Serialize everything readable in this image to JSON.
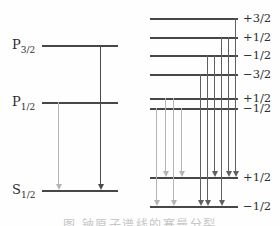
{
  "colors": {
    "background": "#fefefe",
    "level_line": "#474747",
    "label": "#2e2e2e",
    "light_arrow": "#b5b5b5",
    "dark_arrow": "#606060",
    "left_dark_arrow": "#4a4a4a",
    "caption": "#c6c6c6"
  },
  "left_diagram": {
    "label_x": 12,
    "levels": [
      {
        "name": "P3/2",
        "label_main": "P",
        "label_sub": "3/2",
        "x": 42,
        "width": 76,
        "y": 45
      },
      {
        "name": "P1/2",
        "label_main": "P",
        "label_sub": "1/2",
        "x": 42,
        "width": 76,
        "y": 102
      },
      {
        "name": "S1/2",
        "label_main": "S",
        "label_sub": "1/2",
        "x": 42,
        "width": 76,
        "y": 190
      }
    ],
    "transitions": [
      {
        "from": "P1/2",
        "to": "S1/2",
        "x": 58,
        "y1": 102,
        "y2": 190,
        "shade": "light"
      },
      {
        "from": "P3/2",
        "to": "S1/2",
        "x": 100,
        "y1": 45,
        "y2": 190,
        "shade": "left_dark"
      }
    ]
  },
  "right_diagram": {
    "x": 150,
    "width": 88,
    "label_x": 243,
    "levels": [
      {
        "label": "+3/2",
        "y": 18,
        "group": "P3/2"
      },
      {
        "label": "+1/2",
        "y": 37,
        "group": "P3/2"
      },
      {
        "label": "−1/2",
        "y": 55,
        "group": "P3/2"
      },
      {
        "label": "−3/2",
        "y": 74,
        "group": "P3/2"
      },
      {
        "label": "+1/2",
        "y": 98,
        "group": "P1/2"
      },
      {
        "label": "−1/2",
        "y": 108,
        "group": "P1/2"
      },
      {
        "label": "+1/2",
        "y": 177,
        "group": "S1/2"
      },
      {
        "label": "−1/2",
        "y": 206,
        "group": "S1/2"
      }
    ],
    "transitions": [
      {
        "x": 156,
        "y1": 108,
        "y2": 206,
        "shade": "light"
      },
      {
        "x": 165,
        "y1": 98,
        "y2": 177,
        "shade": "light"
      },
      {
        "x": 173,
        "y1": 98,
        "y2": 206,
        "shade": "light"
      },
      {
        "x": 181,
        "y1": 108,
        "y2": 177,
        "shade": "light"
      },
      {
        "x": 200,
        "y1": 74,
        "y2": 206,
        "shade": "dark"
      },
      {
        "x": 207,
        "y1": 55,
        "y2": 206,
        "shade": "dark"
      },
      {
        "x": 214,
        "y1": 55,
        "y2": 177,
        "shade": "dark"
      },
      {
        "x": 221,
        "y1": 37,
        "y2": 206,
        "shade": "dark"
      },
      {
        "x": 228,
        "y1": 37,
        "y2": 177,
        "shade": "dark"
      },
      {
        "x": 235,
        "y1": 18,
        "y2": 177,
        "shade": "dark"
      }
    ]
  },
  "caption": {
    "text": "图  钠原子谱线的塞曼分裂"
  }
}
